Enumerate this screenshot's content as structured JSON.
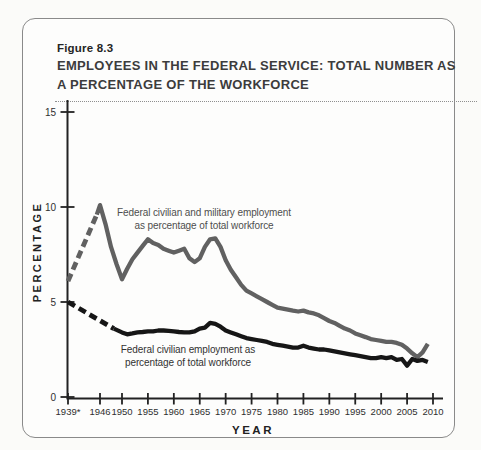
{
  "figure": {
    "label": "Figure 8.3",
    "title_line1": "EMPLOYEES IN THE FEDERAL SERVICE: TOTAL NUMBER AS",
    "title_line2": "A PERCENTAGE OF THE WORKFORCE"
  },
  "chart_data": {
    "type": "line",
    "title": "EMPLOYEES IN THE FEDERAL SERVICE: TOTAL NUMBER AS A PERCENTAGE OF THE WORKFORCE",
    "xlabel": "YEAR",
    "ylabel": "PERCENTAGE",
    "ylim": [
      0,
      15
    ],
    "y_ticks": [
      0,
      5,
      10,
      15
    ],
    "x_tick_labels": [
      "1939*",
      "1946",
      "1950",
      "1955",
      "1960",
      "1965",
      "1970",
      "1975",
      "1980",
      "1985",
      "1990",
      "1995",
      "2000",
      "2005",
      "2010"
    ],
    "grid": false,
    "legend_position": "annotations-on-chart",
    "annotations": [
      {
        "text_line1": "Federal civilian and military employment",
        "text_line2": "as percentage of total workforce"
      },
      {
        "text_line1": "Federal civilian employment as",
        "text_line2": "percentage of total workforce"
      }
    ],
    "series": [
      {
        "name": "Federal civilian and military employment as percentage of total workforce",
        "color": "#616161",
        "dashed_points": [
          [
            1939,
            6.1
          ],
          [
            1945.3,
            9.6
          ]
        ],
        "points": [
          [
            1945.3,
            9.6
          ],
          [
            1946,
            10.1
          ],
          [
            1947,
            9.1
          ],
          [
            1948,
            7.9
          ],
          [
            1949,
            7.0
          ],
          [
            1950,
            6.2
          ],
          [
            1951,
            6.75
          ],
          [
            1952,
            7.25
          ],
          [
            1953,
            7.6
          ],
          [
            1954,
            7.95
          ],
          [
            1955,
            8.3
          ],
          [
            1956,
            8.1
          ],
          [
            1957,
            8.0
          ],
          [
            1958,
            7.8
          ],
          [
            1959,
            7.7
          ],
          [
            1960,
            7.6
          ],
          [
            1961,
            7.7
          ],
          [
            1962,
            7.8
          ],
          [
            1963,
            7.3
          ],
          [
            1964,
            7.1
          ],
          [
            1965,
            7.3
          ],
          [
            1966,
            7.9
          ],
          [
            1967,
            8.3
          ],
          [
            1968,
            8.35
          ],
          [
            1969,
            7.9
          ],
          [
            1970,
            7.2
          ],
          [
            1971,
            6.7
          ],
          [
            1972,
            6.3
          ],
          [
            1973,
            5.9
          ],
          [
            1974,
            5.6
          ],
          [
            1975,
            5.45
          ],
          [
            1976,
            5.3
          ],
          [
            1977,
            5.15
          ],
          [
            1978,
            5.0
          ],
          [
            1979,
            4.85
          ],
          [
            1980,
            4.7
          ],
          [
            1981,
            4.65
          ],
          [
            1982,
            4.6
          ],
          [
            1983,
            4.55
          ],
          [
            1984,
            4.5
          ],
          [
            1985,
            4.55
          ],
          [
            1986,
            4.45
          ],
          [
            1987,
            4.4
          ],
          [
            1988,
            4.3
          ],
          [
            1989,
            4.15
          ],
          [
            1990,
            4.0
          ],
          [
            1991,
            3.9
          ],
          [
            1992,
            3.75
          ],
          [
            1993,
            3.6
          ],
          [
            1994,
            3.5
          ],
          [
            1995,
            3.35
          ],
          [
            1996,
            3.25
          ],
          [
            1997,
            3.15
          ],
          [
            1998,
            3.05
          ],
          [
            1999,
            3.0
          ],
          [
            2000,
            2.95
          ],
          [
            2001,
            2.9
          ],
          [
            2002,
            2.9
          ],
          [
            2003,
            2.85
          ],
          [
            2004,
            2.75
          ],
          [
            2005,
            2.55
          ],
          [
            2006,
            2.3
          ],
          [
            2007,
            2.1
          ],
          [
            2008,
            2.35
          ],
          [
            2009,
            2.8
          ]
        ]
      },
      {
        "name": "Federal civilian employment as percentage of total workforce",
        "color": "#161616",
        "dashed_points": [
          [
            1939,
            5.0
          ],
          [
            1948.5,
            3.6
          ]
        ],
        "points": [
          [
            1948.5,
            3.6
          ],
          [
            1950,
            3.4
          ],
          [
            1951,
            3.3
          ],
          [
            1952,
            3.35
          ],
          [
            1953,
            3.4
          ],
          [
            1954,
            3.42
          ],
          [
            1955,
            3.45
          ],
          [
            1956,
            3.45
          ],
          [
            1957,
            3.5
          ],
          [
            1958,
            3.5
          ],
          [
            1959,
            3.48
          ],
          [
            1960,
            3.45
          ],
          [
            1961,
            3.42
          ],
          [
            1962,
            3.4
          ],
          [
            1963,
            3.4
          ],
          [
            1964,
            3.45
          ],
          [
            1965,
            3.6
          ],
          [
            1966,
            3.65
          ],
          [
            1967,
            3.9
          ],
          [
            1968,
            3.85
          ],
          [
            1969,
            3.7
          ],
          [
            1970,
            3.5
          ],
          [
            1971,
            3.4
          ],
          [
            1972,
            3.3
          ],
          [
            1973,
            3.2
          ],
          [
            1974,
            3.1
          ],
          [
            1975,
            3.05
          ],
          [
            1976,
            3.0
          ],
          [
            1977,
            2.95
          ],
          [
            1978,
            2.9
          ],
          [
            1979,
            2.8
          ],
          [
            1980,
            2.75
          ],
          [
            1981,
            2.7
          ],
          [
            1982,
            2.65
          ],
          [
            1983,
            2.6
          ],
          [
            1984,
            2.6
          ],
          [
            1985,
            2.7
          ],
          [
            1986,
            2.6
          ],
          [
            1987,
            2.55
          ],
          [
            1988,
            2.5
          ],
          [
            1989,
            2.5
          ],
          [
            1990,
            2.45
          ],
          [
            1991,
            2.4
          ],
          [
            1992,
            2.35
          ],
          [
            1993,
            2.3
          ],
          [
            1994,
            2.25
          ],
          [
            1995,
            2.2
          ],
          [
            1996,
            2.15
          ],
          [
            1997,
            2.1
          ],
          [
            1998,
            2.05
          ],
          [
            1999,
            2.05
          ],
          [
            2000,
            2.1
          ],
          [
            2001,
            2.05
          ],
          [
            2002,
            2.1
          ],
          [
            2003,
            1.95
          ],
          [
            2004,
            2.0
          ],
          [
            2005,
            1.65
          ],
          [
            2006,
            2.0
          ],
          [
            2007,
            1.9
          ],
          [
            2008,
            1.95
          ],
          [
            2009,
            1.85
          ]
        ]
      }
    ]
  }
}
